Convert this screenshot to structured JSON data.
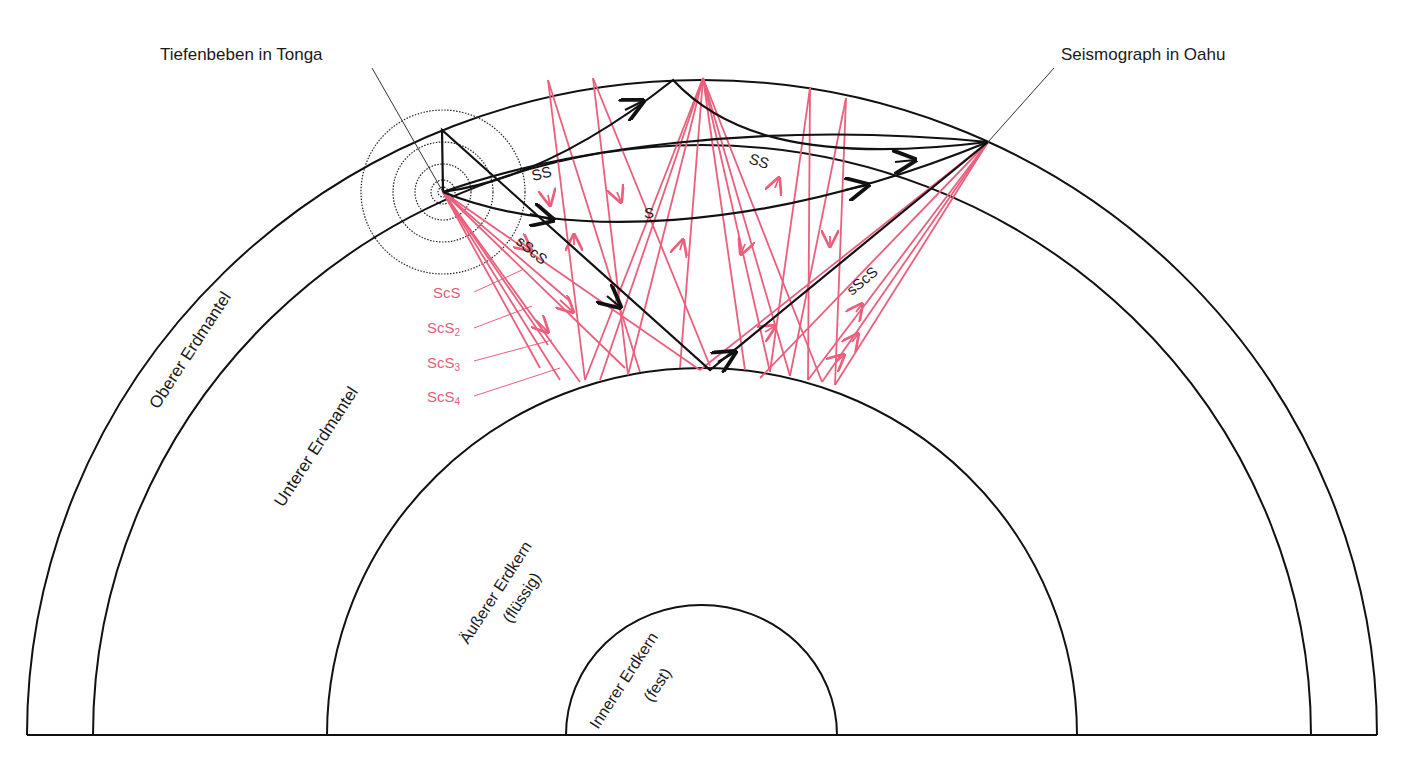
{
  "labels": {
    "source": "Tiefenbeben in Tonga",
    "station": "Seismograph in Oahu",
    "upper_mantle": "Oberer Erdmantel",
    "lower_mantle": "Unterer Erdmantel",
    "outer_core": "Äußerer Erdkern",
    "outer_core_state": "(flüssig)",
    "inner_core": "Innerer Erdkern",
    "inner_core_state": "(fest)"
  },
  "phases": {
    "ss_1": "SS",
    "ss_2": "SS",
    "s": "S",
    "sscs_1": "sScS",
    "sscs_2": "sScS",
    "scs": "ScS",
    "scs2": "ScS",
    "scs2_sub": "2",
    "scs3": "ScS",
    "scs3_sub": "3",
    "scs4": "ScS",
    "scs4_sub": "4"
  },
  "colors": {
    "black_rays": "#111111",
    "red_rays": "#ea5f7c",
    "background": "#ffffff"
  }
}
